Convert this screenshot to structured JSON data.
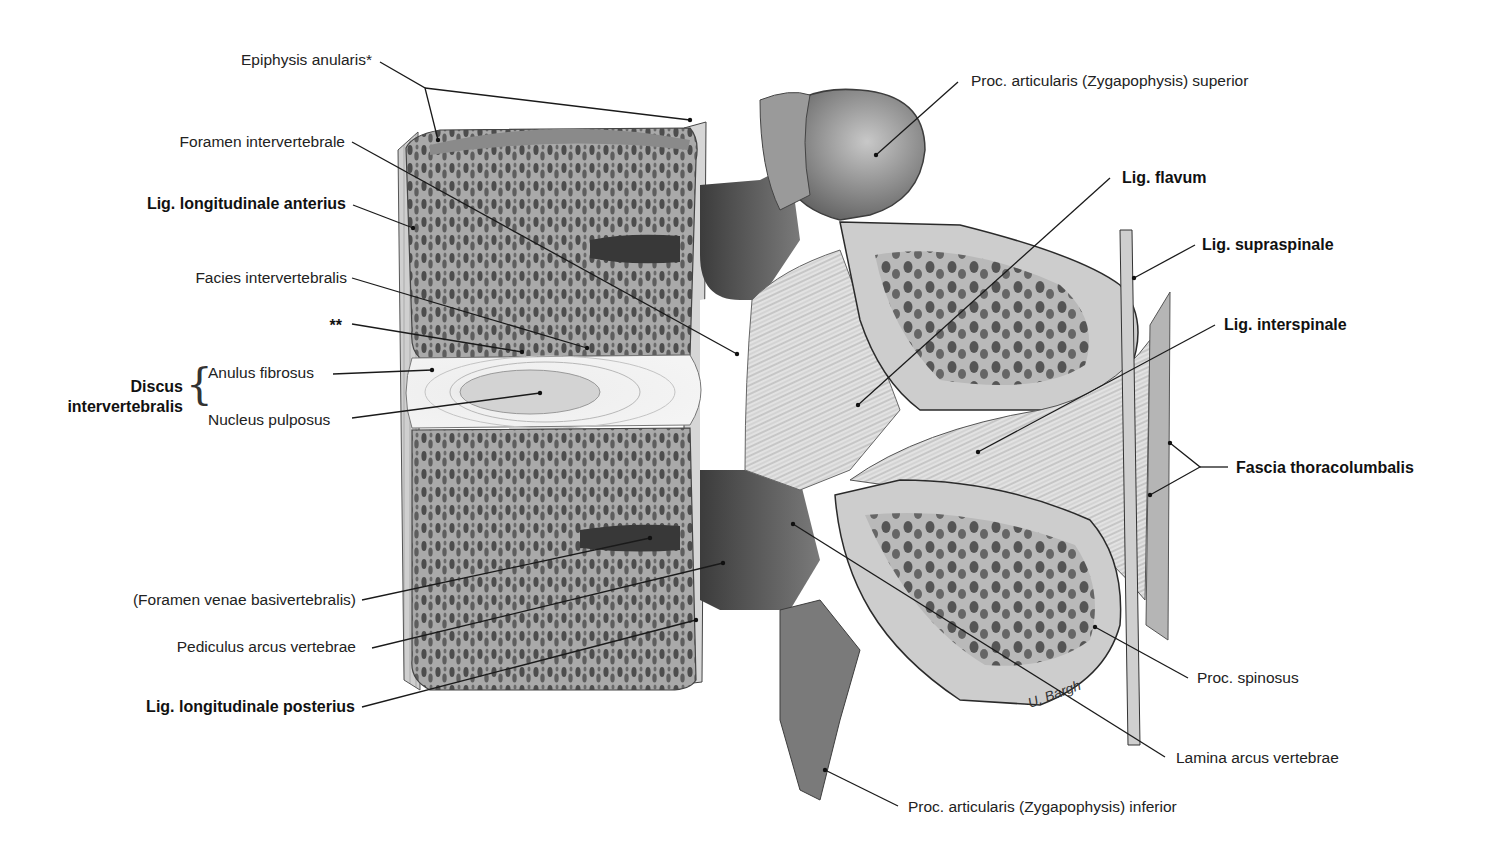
{
  "figure": {
    "signature": "U. Bargh",
    "colors": {
      "background": "#ffffff",
      "bone_light": "#c9c9c9",
      "bone_mid": "#8e8e8e",
      "bone_dark": "#4a4a4a",
      "disc": "#ececec",
      "leader_line": "#1a1a1a",
      "text": "#222222"
    }
  },
  "labels": {
    "left": [
      {
        "id": "epiphysis",
        "text": "Epiphysis anularis*",
        "bold": false
      },
      {
        "id": "foramen_iv",
        "text": "Foramen intervertebrale",
        "bold": false
      },
      {
        "id": "lig_long_ant",
        "text": "Lig. longitudinale anterius",
        "bold": true
      },
      {
        "id": "facies_iv",
        "text": "Facies intervertebralis",
        "bold": false
      },
      {
        "id": "double_star",
        "text": "**",
        "bold": false
      },
      {
        "id": "discus",
        "text": "Discus intervertebralis",
        "line1": "Discus",
        "line2": "intervertebralis",
        "bold": true
      },
      {
        "id": "anulus",
        "text": "Anulus fibrosus",
        "bold": false
      },
      {
        "id": "nucleus",
        "text": "Nucleus pulposus",
        "bold": false
      },
      {
        "id": "foramen_venae",
        "text": "(Foramen venae basivertebralis)",
        "bold": false
      },
      {
        "id": "pediculus",
        "text": "Pediculus arcus vertebrae",
        "bold": false
      },
      {
        "id": "lig_long_post",
        "text": "Lig. longitudinale posterius",
        "bold": true
      }
    ],
    "right": [
      {
        "id": "proc_art_sup",
        "text": "Proc. articularis (Zygapophysis) superior",
        "bold": false
      },
      {
        "id": "lig_flavum",
        "text": "Lig. flavum",
        "bold": true
      },
      {
        "id": "lig_supraspinale",
        "text": "Lig. supraspinale",
        "bold": true
      },
      {
        "id": "lig_interspinale",
        "text": "Lig. interspinale",
        "bold": true
      },
      {
        "id": "fascia",
        "text": "Fascia thoracolumbalis",
        "bold": true
      },
      {
        "id": "proc_spinosus",
        "text": "Proc. spinosus",
        "bold": false
      },
      {
        "id": "lamina",
        "text": "Lamina arcus vertebrae",
        "bold": false
      },
      {
        "id": "proc_art_inf",
        "text": "Proc. articularis (Zygapophysis) inferior",
        "bold": false
      }
    ]
  }
}
